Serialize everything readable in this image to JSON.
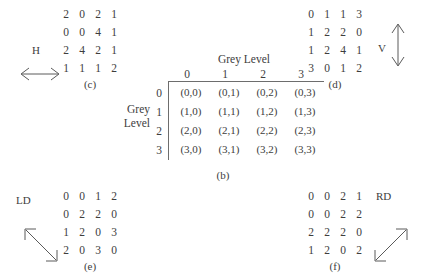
{
  "figure": {
    "background_color": "#ffffff",
    "ink_color": "#3d3d3d",
    "rule_color": "#6d6d6d"
  },
  "panels": {
    "c": {
      "caption": "(c)",
      "direction_label": "H",
      "arrow_icon": "double-arrow-horizontal",
      "matrix": [
        [
          "2",
          "0",
          "2",
          "1"
        ],
        [
          "0",
          "0",
          "4",
          "1"
        ],
        [
          "2",
          "4",
          "2",
          "1"
        ],
        [
          "1",
          "1",
          "1",
          "2"
        ]
      ]
    },
    "d": {
      "caption": "(d)",
      "direction_label": "V",
      "arrow_icon": "double-arrow-vertical",
      "matrix": [
        [
          "0",
          "1",
          "1",
          "3"
        ],
        [
          "1",
          "2",
          "2",
          "0"
        ],
        [
          "1",
          "2",
          "4",
          "1"
        ],
        [
          "3",
          "0",
          "1",
          "2"
        ]
      ]
    },
    "e": {
      "caption": "(e)",
      "direction_label": "LD",
      "arrow_icon": "double-arrow-diagonal-left",
      "matrix": [
        [
          "0",
          "0",
          "1",
          "2"
        ],
        [
          "0",
          "2",
          "2",
          "0"
        ],
        [
          "1",
          "2",
          "0",
          "3"
        ],
        [
          "2",
          "0",
          "3",
          "0"
        ]
      ]
    },
    "f": {
      "caption": "(f)",
      "direction_label": "RD",
      "arrow_icon": "double-arrow-diagonal-right",
      "matrix": [
        [
          "0",
          "0",
          "2",
          "1"
        ],
        [
          "0",
          "0",
          "2",
          "2"
        ],
        [
          "2",
          "2",
          "2",
          "0"
        ],
        [
          "1",
          "2",
          "0",
          "2"
        ]
      ]
    },
    "b": {
      "caption": "(b)",
      "column_header_title": "Grey Level",
      "row_header_line1": "Grey",
      "row_header_line2": "Level",
      "column_labels": [
        "0",
        "1",
        "2",
        "3"
      ],
      "row_labels": [
        "0",
        "1",
        "2",
        "3"
      ],
      "cells": [
        [
          "(0,0)",
          "(0,1)",
          "(0,2)",
          "(0,3)"
        ],
        [
          "(1,0)",
          "(1,1)",
          "(1,2)",
          "(1,3)"
        ],
        [
          "(2,0)",
          "(2,1)",
          "(2,2)",
          "(2,3)"
        ],
        [
          "(3,0)",
          "(3,1)",
          "(3,2)",
          "(3,3)"
        ]
      ]
    }
  }
}
